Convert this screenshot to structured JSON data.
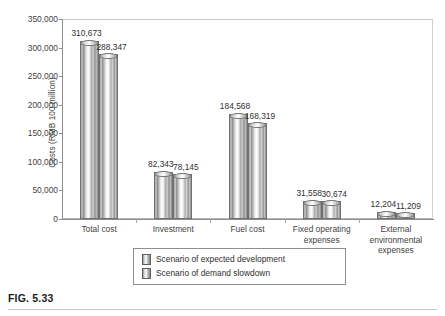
{
  "caption": "FIG. 5.33",
  "chart_data": {
    "type": "bar",
    "title": "",
    "xlabel": "",
    "ylabel": "Costs (RMB 100 million)",
    "ylim": [
      0,
      350000
    ],
    "ytick_labels": [
      "350,000",
      "300,000",
      "250,000",
      "200,000",
      "150,000",
      "100,000",
      "50,000",
      "0"
    ],
    "ytick_values": [
      350000,
      300000,
      250000,
      200000,
      150000,
      100000,
      50000,
      0
    ],
    "grid": false,
    "legend_position": "bottom-center",
    "categories": [
      "Total cost",
      "Investment",
      "Fuel cost",
      "Fixed operating\nexpenses",
      "External\nenvironmental\nexpenses"
    ],
    "series": [
      {
        "name": "Scenario of expected development",
        "values": [
          310673,
          82343,
          184568,
          31558,
          12204
        ],
        "labels": [
          "310,673",
          "82,343",
          "184,568",
          "31,558",
          "12,204"
        ]
      },
      {
        "name": "Scenario of demand slowdown",
        "values": [
          288347,
          78145,
          168319,
          30674,
          11209
        ],
        "labels": [
          "288,347",
          "78,145",
          "168,319",
          "30,674",
          "11,209"
        ]
      }
    ],
    "colors": {
      "series1_fill": "#c9c9c9",
      "series2_fill": "#cfcfcf",
      "bar_outline": "#707070",
      "axis": "#8d8d8d",
      "text": "#3a3a3a",
      "background": "#ffffff"
    }
  }
}
